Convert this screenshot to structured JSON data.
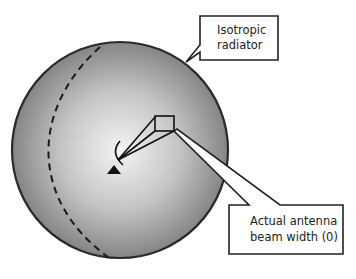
{
  "diagram": {
    "type": "isotropic-radiator-vs-antenna-beam",
    "colors": {
      "sphere_center": "#f2f2f2",
      "sphere_edge": "#8a8a8a",
      "outline": "#222222",
      "background": "#ffffff"
    },
    "labels": {
      "isotropic_line1": "Isotropic",
      "isotropic_line2": "radiator",
      "beam_line1": "Actual antenna",
      "beam_line2": "beam width (0)"
    }
  }
}
